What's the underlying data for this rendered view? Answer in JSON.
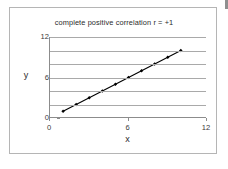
{
  "chart_data": {
    "type": "line",
    "title": "complete positive correlation r = +1",
    "xlabel": "x",
    "ylabel": "y",
    "xlim": [
      0,
      12
    ],
    "ylim": [
      0,
      12
    ],
    "xticks": [
      "0",
      "6",
      "12"
    ],
    "xtick_values": [
      0,
      6,
      12
    ],
    "yticks": [
      "0",
      "6",
      "12"
    ],
    "ytick_values": [
      0,
      6,
      12
    ],
    "gridlines_y": [
      0,
      2,
      4,
      6,
      8,
      10,
      12
    ],
    "grid": "horizontal",
    "legend": "none",
    "marker": "diamond",
    "line_color": "#000000",
    "grid_color": "#a9a9a9",
    "axis_color": "#8c8c8c",
    "series": [
      {
        "name": "series1",
        "x": [
          1,
          2,
          3,
          4,
          5,
          6,
          7,
          8,
          9,
          10
        ],
        "y": [
          1,
          2,
          3,
          4,
          5,
          6,
          7,
          8,
          9,
          10
        ]
      }
    ]
  },
  "frame": {
    "border_color": "#b5b5b5",
    "background": "#ffffff"
  }
}
